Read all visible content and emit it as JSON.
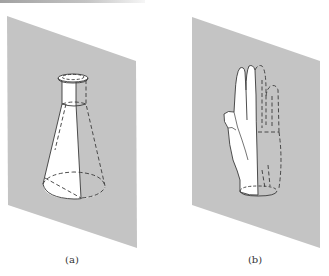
{
  "figure": {
    "panels": [
      {
        "id": "a",
        "caption": "(a)",
        "object": "erlenmeyer-flask",
        "description": "Flask intersected by a vertical gray plane; visible half drawn solid, hidden half dashed"
      },
      {
        "id": "b",
        "caption": "(b)",
        "object": "hand",
        "description": "Hand intersected by a vertical gray plane; front half drawn solid, mirrored/hidden half dashed"
      }
    ],
    "colors": {
      "plane": "#c4c4c4",
      "object_fill": "#ffffff",
      "outline": "#3a3a3a",
      "background": "#ffffff"
    }
  }
}
